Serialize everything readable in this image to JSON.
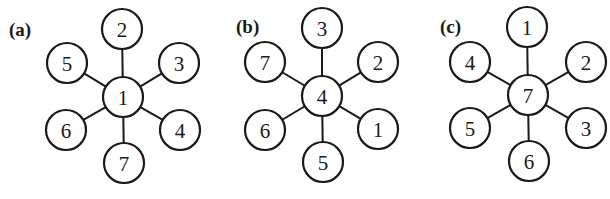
{
  "figure": {
    "width": 610,
    "height": 199,
    "node_radius": 20,
    "colors": {
      "stroke": "#1a1a1a",
      "fill": "#ffffff",
      "background": "#ffffff"
    },
    "panels": [
      {
        "id": "a",
        "label": "(a)",
        "label_pos": [
          9,
          36
        ],
        "center": {
          "label": "1",
          "x": 123,
          "y": 97
        },
        "leaves": [
          {
            "position": "top",
            "label": "2",
            "x": 122,
            "y": 29
          },
          {
            "position": "upper-right",
            "label": "3",
            "x": 179,
            "y": 63
          },
          {
            "position": "lower-right",
            "label": "4",
            "x": 180,
            "y": 130
          },
          {
            "position": "bottom",
            "label": "7",
            "x": 124,
            "y": 163
          },
          {
            "position": "lower-left",
            "label": "6",
            "x": 66,
            "y": 130
          },
          {
            "position": "upper-left",
            "label": "5",
            "x": 67,
            "y": 63
          }
        ]
      },
      {
        "id": "b",
        "label": "(b)",
        "label_pos": [
          236,
          33
        ],
        "center": {
          "label": "4",
          "x": 322,
          "y": 96
        },
        "leaves": [
          {
            "position": "top",
            "label": "3",
            "x": 322,
            "y": 28
          },
          {
            "position": "upper-right",
            "label": "2",
            "x": 378,
            "y": 62
          },
          {
            "position": "lower-right",
            "label": "1",
            "x": 378,
            "y": 129
          },
          {
            "position": "bottom",
            "label": "5",
            "x": 323,
            "y": 162
          },
          {
            "position": "lower-left",
            "label": "6",
            "x": 265,
            "y": 130
          },
          {
            "position": "upper-left",
            "label": "7",
            "x": 265,
            "y": 62
          }
        ]
      },
      {
        "id": "c",
        "label": "(c)",
        "label_pos": [
          440,
          33
        ],
        "center": {
          "label": "7",
          "x": 528,
          "y": 95
        },
        "leaves": [
          {
            "position": "top",
            "label": "1",
            "x": 527,
            "y": 27
          },
          {
            "position": "upper-right",
            "label": "2",
            "x": 586,
            "y": 62
          },
          {
            "position": "lower-right",
            "label": "3",
            "x": 586,
            "y": 128
          },
          {
            "position": "bottom",
            "label": "6",
            "x": 529,
            "y": 161
          },
          {
            "position": "lower-left",
            "label": "5",
            "x": 470,
            "y": 128
          },
          {
            "position": "upper-left",
            "label": "4",
            "x": 470,
            "y": 62
          }
        ]
      }
    ]
  }
}
